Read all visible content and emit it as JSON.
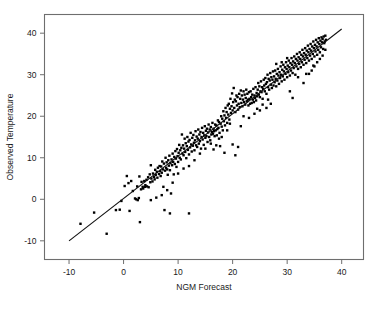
{
  "chart_data": {
    "type": "scatter",
    "title": "",
    "xlabel": "NGM Forecast",
    "ylabel": "Observed Temperature",
    "xlim": [
      -14.5,
      44
    ],
    "ylim": [
      -14.5,
      44.5
    ],
    "xticks": [
      -10,
      0,
      10,
      20,
      30,
      40
    ],
    "xtick_labels": [
      "-10",
      "0",
      "10",
      "20",
      "30",
      "40"
    ],
    "yticks": [
      -10,
      0,
      10,
      20,
      30,
      40
    ],
    "ytick_labels": [
      "-10",
      "0",
      "10",
      "20",
      "30",
      "40"
    ],
    "grid": false,
    "legend": "none",
    "marker": {
      "shape": "square",
      "size": 2.4,
      "color": "#000000"
    },
    "fit_line": {
      "label": "regression line",
      "color": "#111111",
      "x": [
        -10.0,
        40.0
      ],
      "y": [
        -10.0,
        41.0
      ]
    },
    "points": [
      [
        -7.9,
        -5.9
      ],
      [
        -5.4,
        -3.2
      ],
      [
        -3.1,
        -8.3
      ],
      [
        -1.4,
        -2.6
      ],
      [
        -0.7,
        -2.5
      ],
      [
        -0.4,
        -0.4
      ],
      [
        0.2,
        3.2
      ],
      [
        0.6,
        5.6
      ],
      [
        0.9,
        3.9
      ],
      [
        1.1,
        -2.8
      ],
      [
        1.4,
        4.4
      ],
      [
        1.7,
        2.0
      ],
      [
        2.1,
        0.2
      ],
      [
        2.3,
        0.0
      ],
      [
        2.5,
        3.1
      ],
      [
        2.6,
        -0.2
      ],
      [
        2.8,
        0.3
      ],
      [
        2.9,
        5.5
      ],
      [
        3.0,
        -5.5
      ],
      [
        3.2,
        2.4
      ],
      [
        3.3,
        4.2
      ],
      [
        3.5,
        3.0
      ],
      [
        3.6,
        2.6
      ],
      [
        3.8,
        4.4
      ],
      [
        3.9,
        3.0
      ],
      [
        4.0,
        3.4
      ],
      [
        4.2,
        4.7
      ],
      [
        4.3,
        3.1
      ],
      [
        4.5,
        5.3
      ],
      [
        4.6,
        2.9
      ],
      [
        4.8,
        6.0
      ],
      [
        4.9,
        4.1
      ],
      [
        5.0,
        8.2
      ],
      [
        5.1,
        5.0
      ],
      [
        5.3,
        4.3
      ],
      [
        5.4,
        6.2
      ],
      [
        5.6,
        5.4
      ],
      [
        5.7,
        4.8
      ],
      [
        5.8,
        7.1
      ],
      [
        5.9,
        5.9
      ],
      [
        6.1,
        6.6
      ],
      [
        6.2,
        5.2
      ],
      [
        6.3,
        7.6
      ],
      [
        6.5,
        6.1
      ],
      [
        6.6,
        8.0
      ],
      [
        6.7,
        6.8
      ],
      [
        6.8,
        5.6
      ],
      [
        6.9,
        7.9
      ],
      [
        7.0,
        6.4
      ],
      [
        7.1,
        9.1
      ],
      [
        7.2,
        7.2
      ],
      [
        7.3,
        3.0
      ],
      [
        7.4,
        8.6
      ],
      [
        7.5,
        -2.6
      ],
      [
        7.6,
        6.9
      ],
      [
        7.7,
        10.0
      ],
      [
        7.8,
        7.6
      ],
      [
        7.9,
        8.9
      ],
      [
        8.0,
        7.2
      ],
      [
        8.1,
        5.9
      ],
      [
        8.2,
        9.4
      ],
      [
        8.3,
        8.1
      ],
      [
        8.4,
        10.5
      ],
      [
        8.5,
        7.0
      ],
      [
        8.6,
        8.7
      ],
      [
        8.7,
        1.4
      ],
      [
        8.8,
        9.6
      ],
      [
        8.9,
        8.2
      ],
      [
        9.0,
        11.0
      ],
      [
        9.1,
        9.0
      ],
      [
        9.2,
        6.0
      ],
      [
        9.3,
        10.2
      ],
      [
        9.4,
        8.5
      ],
      [
        9.5,
        11.6
      ],
      [
        9.6,
        9.8
      ],
      [
        9.7,
        7.8
      ],
      [
        9.8,
        12.1
      ],
      [
        9.9,
        10.4
      ],
      [
        10.0,
        9.0
      ],
      [
        10.1,
        11.2
      ],
      [
        10.2,
        13.1
      ],
      [
        10.3,
        10.0
      ],
      [
        10.4,
        11.8
      ],
      [
        10.5,
        9.6
      ],
      [
        10.6,
        12.4
      ],
      [
        10.7,
        15.6
      ],
      [
        10.8,
        11.0
      ],
      [
        10.9,
        13.0
      ],
      [
        11.0,
        10.6
      ],
      [
        11.1,
        12.2
      ],
      [
        11.2,
        14.6
      ],
      [
        11.3,
        11.4
      ],
      [
        11.4,
        13.5
      ],
      [
        11.5,
        9.9
      ],
      [
        11.6,
        12.8
      ],
      [
        11.7,
        15.0
      ],
      [
        11.8,
        11.9
      ],
      [
        11.9,
        13.9
      ],
      [
        12.0,
        10.8
      ],
      [
        12.1,
        14.3
      ],
      [
        12.2,
        12.5
      ],
      [
        12.3,
        16.0
      ],
      [
        12.4,
        13.2
      ],
      [
        12.5,
        11.5
      ],
      [
        12.6,
        14.8
      ],
      [
        12.7,
        12.9
      ],
      [
        12.8,
        15.5
      ],
      [
        12.9,
        13.6
      ],
      [
        13.0,
        11.8
      ],
      [
        13.1,
        14.2
      ],
      [
        13.2,
        16.4
      ],
      [
        13.3,
        13.0
      ],
      [
        13.4,
        15.1
      ],
      [
        13.5,
        12.6
      ],
      [
        13.6,
        14.6
      ],
      [
        13.7,
        16.8
      ],
      [
        13.8,
        13.4
      ],
      [
        13.9,
        15.6
      ],
      [
        14.0,
        14.0
      ],
      [
        14.1,
        16.2
      ],
      [
        14.2,
        12.2
      ],
      [
        14.3,
        15.0
      ],
      [
        14.4,
        17.2
      ],
      [
        14.5,
        14.4
      ],
      [
        14.6,
        16.0
      ],
      [
        14.7,
        13.1
      ],
      [
        14.8,
        15.4
      ],
      [
        14.9,
        17.6
      ],
      [
        15.0,
        14.8
      ],
      [
        15.1,
        16.5
      ],
      [
        15.2,
        15.2
      ],
      [
        15.3,
        17.0
      ],
      [
        15.4,
        13.8
      ],
      [
        15.5,
        16.1
      ],
      [
        15.6,
        18.0
      ],
      [
        15.7,
        15.0
      ],
      [
        15.8,
        16.8
      ],
      [
        15.9,
        14.2
      ],
      [
        16.0,
        17.4
      ],
      [
        16.1,
        15.6
      ],
      [
        16.2,
        16.2
      ],
      [
        16.3,
        18.4
      ],
      [
        16.4,
        15.8
      ],
      [
        16.5,
        17.0
      ],
      [
        16.6,
        16.4
      ],
      [
        16.7,
        15.2
      ],
      [
        16.8,
        18.0
      ],
      [
        16.9,
        16.6
      ],
      [
        17.0,
        17.8
      ],
      [
        17.1,
        15.4
      ],
      [
        17.2,
        16.9
      ],
      [
        17.3,
        19.0
      ],
      [
        17.4,
        17.2
      ],
      [
        17.5,
        18.6
      ],
      [
        17.6,
        16.0
      ],
      [
        17.7,
        12.8
      ],
      [
        17.8,
        18.2
      ],
      [
        17.9,
        20.0
      ],
      [
        18.0,
        17.5
      ],
      [
        18.1,
        19.4
      ],
      [
        18.2,
        16.6
      ],
      [
        18.3,
        21.2
      ],
      [
        18.4,
        18.8
      ],
      [
        18.5,
        20.2
      ],
      [
        18.6,
        17.8
      ],
      [
        18.7,
        22.0
      ],
      [
        18.8,
        19.6
      ],
      [
        18.9,
        21.0
      ],
      [
        19.0,
        18.4
      ],
      [
        19.1,
        22.6
      ],
      [
        19.2,
        20.4
      ],
      [
        19.3,
        23.0
      ],
      [
        19.4,
        19.2
      ],
      [
        19.5,
        21.8
      ],
      [
        19.6,
        24.2
      ],
      [
        19.7,
        20.8
      ],
      [
        19.8,
        22.4
      ],
      [
        19.9,
        25.5
      ],
      [
        20.0,
        21.4
      ],
      [
        20.1,
        23.4
      ],
      [
        20.2,
        26.8
      ],
      [
        20.3,
        22.0
      ],
      [
        20.4,
        24.0
      ],
      [
        20.5,
        21.0
      ],
      [
        20.6,
        23.6
      ],
      [
        20.7,
        25.0
      ],
      [
        20.8,
        22.6
      ],
      [
        20.9,
        24.6
      ],
      [
        21.0,
        21.6
      ],
      [
        21.1,
        23.0
      ],
      [
        21.2,
        25.4
      ],
      [
        21.3,
        22.2
      ],
      [
        21.4,
        24.2
      ],
      [
        21.5,
        26.2
      ],
      [
        21.6,
        23.2
      ],
      [
        21.7,
        25.0
      ],
      [
        21.8,
        22.4
      ],
      [
        21.9,
        24.0
      ],
      [
        22.0,
        26.0
      ],
      [
        22.1,
        23.4
      ],
      [
        22.2,
        25.2
      ],
      [
        22.3,
        22.8
      ],
      [
        22.4,
        24.4
      ],
      [
        22.5,
        26.4
      ],
      [
        22.6,
        23.6
      ],
      [
        22.7,
        25.4
      ],
      [
        22.8,
        24.0
      ],
      [
        22.9,
        22.6
      ],
      [
        23.0,
        25.8
      ],
      [
        23.1,
        24.2
      ],
      [
        23.2,
        23.0
      ],
      [
        23.3,
        26.0
      ],
      [
        23.4,
        24.6
      ],
      [
        23.5,
        23.2
      ],
      [
        23.6,
        25.2
      ],
      [
        23.7,
        24.0
      ],
      [
        23.8,
        26.6
      ],
      [
        23.9,
        23.4
      ],
      [
        24.0,
        25.0
      ],
      [
        24.1,
        24.4
      ],
      [
        24.2,
        27.0
      ],
      [
        24.3,
        23.8
      ],
      [
        24.4,
        25.6
      ],
      [
        24.5,
        24.8
      ],
      [
        24.6,
        26.4
      ],
      [
        24.7,
        28.0
      ],
      [
        24.8,
        25.2
      ],
      [
        24.9,
        27.2
      ],
      [
        25.0,
        24.6
      ],
      [
        25.1,
        26.0
      ],
      [
        25.2,
        28.4
      ],
      [
        25.3,
        25.8
      ],
      [
        25.4,
        27.0
      ],
      [
        25.5,
        24.2
      ],
      [
        25.6,
        26.6
      ],
      [
        25.7,
        28.8
      ],
      [
        25.8,
        27.4
      ],
      [
        25.9,
        26.0
      ],
      [
        26.0,
        29.2
      ],
      [
        26.1,
        27.8
      ],
      [
        26.2,
        25.4
      ],
      [
        26.3,
        28.2
      ],
      [
        26.4,
        30.0
      ],
      [
        26.5,
        27.0
      ],
      [
        26.6,
        29.0
      ],
      [
        26.7,
        26.4
      ],
      [
        26.8,
        28.6
      ],
      [
        26.9,
        30.4
      ],
      [
        27.0,
        27.6
      ],
      [
        27.1,
        29.4
      ],
      [
        27.2,
        26.8
      ],
      [
        27.3,
        28.8
      ],
      [
        27.4,
        30.8
      ],
      [
        27.5,
        27.4
      ],
      [
        27.6,
        29.6
      ],
      [
        27.7,
        28.2
      ],
      [
        27.8,
        31.0
      ],
      [
        27.9,
        29.0
      ],
      [
        28.0,
        27.2
      ],
      [
        28.1,
        30.2
      ],
      [
        28.2,
        28.6
      ],
      [
        28.3,
        31.4
      ],
      [
        28.4,
        29.8
      ],
      [
        28.5,
        27.8
      ],
      [
        28.6,
        30.6
      ],
      [
        28.7,
        29.2
      ],
      [
        28.8,
        32.0
      ],
      [
        28.9,
        30.0
      ],
      [
        29.0,
        28.4
      ],
      [
        29.1,
        31.2
      ],
      [
        29.2,
        29.6
      ],
      [
        29.3,
        32.4
      ],
      [
        29.4,
        30.8
      ],
      [
        29.5,
        28.8
      ],
      [
        29.6,
        31.8
      ],
      [
        29.7,
        30.2
      ],
      [
        29.8,
        33.0
      ],
      [
        29.9,
        31.4
      ],
      [
        30.0,
        29.4
      ],
      [
        30.1,
        32.2
      ],
      [
        30.2,
        30.6
      ],
      [
        30.3,
        33.4
      ],
      [
        30.4,
        31.8
      ],
      [
        30.5,
        29.8
      ],
      [
        30.6,
        32.8
      ],
      [
        30.7,
        31.0
      ],
      [
        30.8,
        34.0
      ],
      [
        30.9,
        32.4
      ],
      [
        31.0,
        30.4
      ],
      [
        31.1,
        33.2
      ],
      [
        31.2,
        31.6
      ],
      [
        31.3,
        34.4
      ],
      [
        31.4,
        32.8
      ],
      [
        31.5,
        30.0
      ],
      [
        31.6,
        33.8
      ],
      [
        31.7,
        32.0
      ],
      [
        31.8,
        35.0
      ],
      [
        31.9,
        33.4
      ],
      [
        32.0,
        31.4
      ],
      [
        32.1,
        34.2
      ],
      [
        32.2,
        32.6
      ],
      [
        32.3,
        35.4
      ],
      [
        32.4,
        33.8
      ],
      [
        32.5,
        31.8
      ],
      [
        32.6,
        34.8
      ],
      [
        32.7,
        33.0
      ],
      [
        32.8,
        36.0
      ],
      [
        32.9,
        34.4
      ],
      [
        33.0,
        32.4
      ],
      [
        33.1,
        35.2
      ],
      [
        33.2,
        33.6
      ],
      [
        33.3,
        36.4
      ],
      [
        33.4,
        34.8
      ],
      [
        33.5,
        32.8
      ],
      [
        33.6,
        35.8
      ],
      [
        33.7,
        34.0
      ],
      [
        33.8,
        37.0
      ],
      [
        33.9,
        35.4
      ],
      [
        34.0,
        33.4
      ],
      [
        34.1,
        36.2
      ],
      [
        34.2,
        34.6
      ],
      [
        34.3,
        37.4
      ],
      [
        34.4,
        35.8
      ],
      [
        34.5,
        33.8
      ],
      [
        34.6,
        36.8
      ],
      [
        34.7,
        35.0
      ],
      [
        34.8,
        38.0
      ],
      [
        34.9,
        36.4
      ],
      [
        35.0,
        34.4
      ],
      [
        35.1,
        37.2
      ],
      [
        35.2,
        35.6
      ],
      [
        35.3,
        38.4
      ],
      [
        35.4,
        36.8
      ],
      [
        35.5,
        34.8
      ],
      [
        35.6,
        37.8
      ],
      [
        35.7,
        36.0
      ],
      [
        35.8,
        38.8
      ],
      [
        35.9,
        37.4
      ],
      [
        36.0,
        35.4
      ],
      [
        36.1,
        38.2
      ],
      [
        36.2,
        36.6
      ],
      [
        36.3,
        39.0
      ],
      [
        36.4,
        37.8
      ],
      [
        36.5,
        38.6
      ],
      [
        36.6,
        36.2
      ],
      [
        36.7,
        39.2
      ],
      [
        36.8,
        37.6
      ],
      [
        36.9,
        38.0
      ],
      [
        37.0,
        39.4
      ],
      [
        37.1,
        38.4
      ],
      [
        24.0,
        20.6
      ],
      [
        25.0,
        21.4
      ],
      [
        26.2,
        22.0
      ],
      [
        27.0,
        23.0
      ],
      [
        22.0,
        20.0
      ],
      [
        30.5,
        26.0
      ],
      [
        31.0,
        24.4
      ],
      [
        32.0,
        29.4
      ],
      [
        33.0,
        28.0
      ],
      [
        34.0,
        30.2
      ],
      [
        19.0,
        16.6
      ],
      [
        20.0,
        13.2
      ],
      [
        20.5,
        10.6
      ],
      [
        21.0,
        12.6
      ],
      [
        18.5,
        11.2
      ],
      [
        17.0,
        13.0
      ],
      [
        16.5,
        12.0
      ],
      [
        14.0,
        11.0
      ],
      [
        13.0,
        9.4
      ],
      [
        12.0,
        8.0
      ],
      [
        11.0,
        7.4
      ],
      [
        10.0,
        6.2
      ],
      [
        9.0,
        4.0
      ],
      [
        8.0,
        2.2
      ],
      [
        7.0,
        1.0
      ],
      [
        6.0,
        0.4
      ],
      [
        5.0,
        -0.2
      ],
      [
        8.5,
        -3.4
      ],
      [
        12.0,
        -3.4
      ],
      [
        29.0,
        33.0
      ],
      [
        30.0,
        34.0
      ],
      [
        28.0,
        32.6
      ],
      [
        33.5,
        30.2
      ],
      [
        34.5,
        31.0
      ],
      [
        35.0,
        32.0
      ],
      [
        21.5,
        17.6
      ],
      [
        23.0,
        19.6
      ],
      [
        24.5,
        21.8
      ],
      [
        25.5,
        22.8
      ],
      [
        26.5,
        24.0
      ],
      [
        15.0,
        12.2
      ],
      [
        16.0,
        13.4
      ],
      [
        17.5,
        14.6
      ],
      [
        18.0,
        15.0
      ],
      [
        19.5,
        18.2
      ],
      [
        36.0,
        33.8
      ],
      [
        36.5,
        34.6
      ],
      [
        37.0,
        36.0
      ],
      [
        35.5,
        33.0
      ],
      [
        34.8,
        32.2
      ]
    ]
  },
  "axes": {
    "x_title": "NGM Forecast",
    "y_title": "Observed Temperature"
  }
}
